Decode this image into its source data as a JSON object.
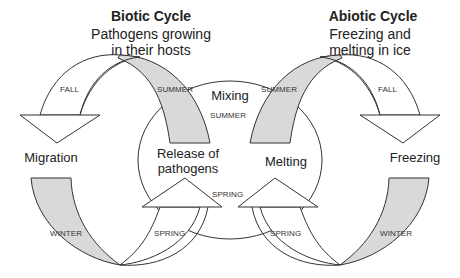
{
  "biotic": {
    "title": "Biotic Cycle",
    "subtitle_line1": "Pathogens growing",
    "subtitle_line2": "in their hosts",
    "stage_left": "Migration",
    "stage_center_line1": "Release of",
    "stage_center_line2": "pathogens",
    "seasons": {
      "fall": "FALL",
      "summer": "SUMMER",
      "winter": "WINTER",
      "spring": "SPRING"
    }
  },
  "abiotic": {
    "title": "Abiotic Cycle",
    "subtitle_line1": "Freezing and",
    "subtitle_line2": "melting in ice",
    "stage_right": "Freezing",
    "stage_center": "Melting",
    "seasons": {
      "fall": "FALL",
      "summer": "SUMMER",
      "winter": "WINTER",
      "spring": "SPRING"
    }
  },
  "shared": {
    "center_top": "Mixing",
    "center_top_season": "SUMMER",
    "center_bottom_season": "SPRING"
  },
  "colors": {
    "stroke": "#333333",
    "shaded": "#d9d9d9",
    "background": "#ffffff"
  }
}
